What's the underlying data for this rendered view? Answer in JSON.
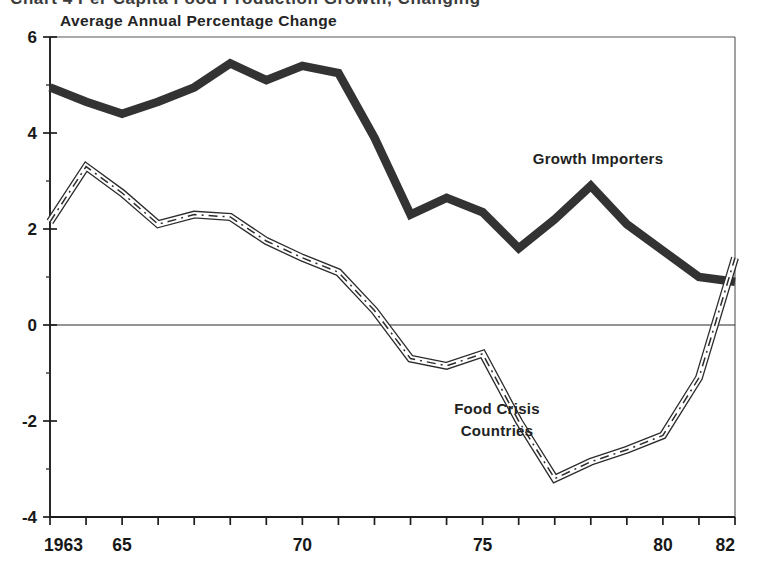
{
  "figure": {
    "clipped_caption": "Chart 4  Per Capita Food Production Growth, Changing",
    "axis_title": "Average Annual Percentage Change"
  },
  "chart_data": {
    "type": "line",
    "title": "Average Annual Percentage Change",
    "xlabel": "",
    "ylabel": "Average Annual Percentage Change",
    "xlim": [
      1963,
      1982
    ],
    "ylim": [
      -4,
      6
    ],
    "yticks": [
      6,
      4,
      2,
      0,
      -2,
      -4
    ],
    "ytick_labels": [
      "6",
      "4",
      "2",
      "0",
      "-2",
      "-4"
    ],
    "yminor_step": 1,
    "xticks": [
      1963,
      1964,
      1965,
      1966,
      1967,
      1968,
      1969,
      1970,
      1971,
      1972,
      1973,
      1974,
      1975,
      1976,
      1977,
      1978,
      1979,
      1980,
      1981,
      1982
    ],
    "xtick_labels": [
      {
        "x": 1963,
        "label": "1963"
      },
      {
        "x": 1965,
        "label": "65"
      },
      {
        "x": 1970,
        "label": "70"
      },
      {
        "x": 1975,
        "label": "75"
      },
      {
        "x": 1980,
        "label": "80"
      },
      {
        "x": 1982,
        "label": "82"
      }
    ],
    "grid": false,
    "zero_line": true,
    "legend": "in-plot annotations",
    "x": [
      1963,
      1964,
      1965,
      1966,
      1967,
      1968,
      1969,
      1970,
      1971,
      1972,
      1973,
      1974,
      1975,
      1976,
      1977,
      1978,
      1979,
      1980,
      1981,
      1982
    ],
    "series": [
      {
        "name": "Growth Importers",
        "style": "thick-solid",
        "color": "#333333",
        "label_position": {
          "x": 1978.2,
          "y": 3.35
        },
        "values": [
          4.95,
          4.65,
          4.4,
          4.65,
          4.95,
          5.45,
          5.1,
          5.4,
          5.25,
          3.9,
          2.3,
          2.65,
          2.35,
          1.6,
          2.2,
          2.9,
          2.1,
          1.55,
          1.0,
          0.9
        ]
      },
      {
        "name": "Food Crisis Countries",
        "style": "dash-dot-outlined",
        "color": "#2c2c2c",
        "label_position": {
          "x": 1975.4,
          "y": -1.85
        },
        "label_lines": [
          "Food Crisis",
          "Countries"
        ],
        "values": [
          2.15,
          3.3,
          2.75,
          2.1,
          2.3,
          2.25,
          1.75,
          1.4,
          1.1,
          0.3,
          -0.7,
          -0.85,
          -0.6,
          -2.0,
          -3.2,
          -2.85,
          -2.6,
          -2.3,
          -1.1,
          1.4
        ]
      }
    ]
  }
}
